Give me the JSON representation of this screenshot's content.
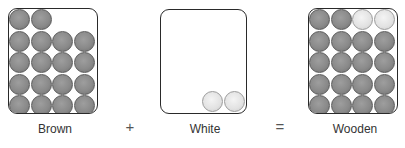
{
  "diagram": {
    "labels": {
      "left": "Brown",
      "middle": "White",
      "right": "Wooden"
    },
    "operators": {
      "plus": "+",
      "equals": "="
    },
    "colors": {
      "brown_ball": "#8a8a8a",
      "white_ball": "#e2e2e2",
      "box_border": "#2a2a2a"
    },
    "boxes": [
      {
        "name": "brown",
        "grid_rows": 5,
        "grid_cols": 4,
        "ball_count": 18,
        "balls": "top row 2 brown, rows 2-5 full brown"
      },
      {
        "name": "white",
        "ball_count": 2,
        "balls": "2 white balls at bottom right"
      },
      {
        "name": "wooden",
        "grid_rows": 5,
        "grid_cols": 4,
        "ball_count": 20,
        "balls": "top row 2 brown + 2 white, rows 2-5 full brown"
      }
    ]
  }
}
